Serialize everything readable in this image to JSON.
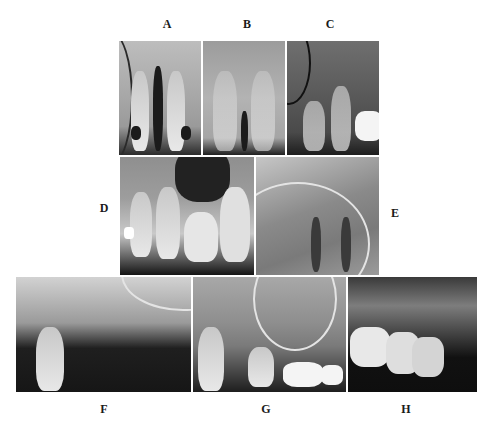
{
  "page": {
    "header_text": "",
    "figure_type": "dental radiographs grid"
  },
  "panels": [
    {
      "id": "A",
      "label": "A",
      "description": "Periapical radiograph of maxillary central incisors"
    },
    {
      "id": "B",
      "label": "B",
      "description": "Periapical radiograph of maxillary anterior teeth"
    },
    {
      "id": "C",
      "label": "C",
      "description": "Periapical radiograph of maxillary canine/premolar region"
    },
    {
      "id": "D",
      "label": "D",
      "description": "Periapical radiograph of maxillary premolar/molar region with restorations"
    },
    {
      "id": "E",
      "label": "E",
      "description": "Periapical radiograph showing maxillary sinus floor"
    },
    {
      "id": "F",
      "label": "F",
      "description": "Periapical radiograph of edentulous maxillary posterior region"
    },
    {
      "id": "G",
      "label": "G",
      "description": "Periapical radiograph of maxillary molar region with sinus"
    },
    {
      "id": "H",
      "label": "H",
      "description": "Periapical radiograph of maxillary molars"
    }
  ]
}
